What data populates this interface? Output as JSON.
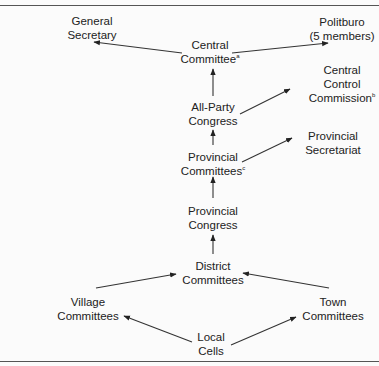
{
  "diagram": {
    "nodes": {
      "general_secretary": {
        "line1": "General",
        "line2": "Secretary",
        "sup": ""
      },
      "politburo": {
        "line1": "Politburo",
        "line2": "(5  members)",
        "sup": ""
      },
      "central_committee": {
        "line1": "Central",
        "line2": "Committee",
        "sup": "a"
      },
      "central_control_commission": {
        "line1": "Central",
        "line2": "Control",
        "line3": "Commission",
        "sup": "b"
      },
      "all_party_congress": {
        "line1": "All-Party",
        "line2": "Congress",
        "sup": ""
      },
      "provincial_secretariat": {
        "line1": "Provincial",
        "line2": "Secretariat",
        "sup": ""
      },
      "provincial_committees": {
        "line1": "Provincial",
        "line2": "Committees",
        "sup": "c"
      },
      "provincial_congress": {
        "line1": "Provincial",
        "line2": "Congress",
        "sup": ""
      },
      "district_committees": {
        "line1": "District",
        "line2": "Committees",
        "sup": ""
      },
      "village_committees": {
        "line1": "Village",
        "line2": "Committees",
        "sup": ""
      },
      "town_committees": {
        "line1": "Town",
        "line2": "Committees",
        "sup": ""
      },
      "local_cells": {
        "line1": "Local",
        "line2": "Cells",
        "sup": ""
      }
    },
    "edges": [
      {
        "from": "central_committee",
        "to": "general_secretary"
      },
      {
        "from": "central_committee",
        "to": "politburo"
      },
      {
        "from": "all_party_congress",
        "to": "central_committee"
      },
      {
        "from": "all_party_congress",
        "to": "central_control_commission"
      },
      {
        "from": "provincial_committees",
        "to": "all_party_congress"
      },
      {
        "from": "provincial_committees",
        "to": "provincial_secretariat"
      },
      {
        "from": "provincial_congress",
        "to": "provincial_committees"
      },
      {
        "from": "district_committees",
        "to": "provincial_congress"
      },
      {
        "from": "village_committees",
        "to": "district_committees"
      },
      {
        "from": "town_committees",
        "to": "district_committees"
      },
      {
        "from": "local_cells",
        "to": "village_committees"
      },
      {
        "from": "local_cells",
        "to": "town_committees"
      }
    ]
  }
}
